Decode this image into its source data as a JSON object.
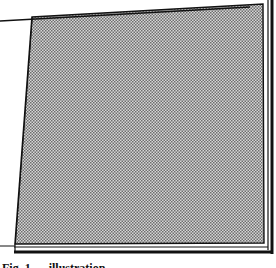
{
  "figure": {
    "shading": "halftone-dots",
    "colors": {
      "ink": "#111111",
      "paper": "#ffffff",
      "halftone_light": "#d8d8d8",
      "halftone_dark": "#7a7a7a"
    }
  },
  "caption": {
    "text": "Fig. 1 — illustration"
  }
}
